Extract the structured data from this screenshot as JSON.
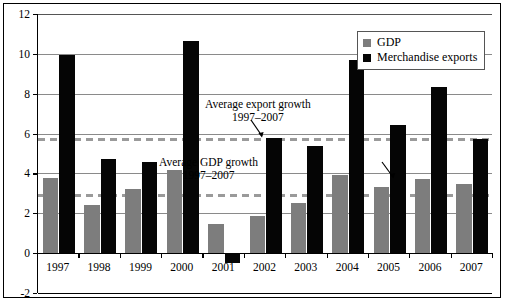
{
  "chart_data": {
    "type": "bar",
    "title": "",
    "subtitle": "",
    "xlabel": "",
    "ylabel": "",
    "categories": [
      "1997",
      "1998",
      "1999",
      "2000",
      "2001",
      "2002",
      "2003",
      "2004",
      "2005",
      "2006",
      "2007"
    ],
    "series": [
      {
        "name": "GDP",
        "color": "#7d7d7d",
        "values": [
          3.75,
          2.4,
          3.2,
          4.15,
          1.45,
          1.85,
          2.5,
          3.9,
          3.3,
          3.7,
          3.45
        ]
      },
      {
        "name": "Merchandise exports",
        "color": "#050505",
        "values": [
          9.95,
          4.7,
          4.55,
          10.65,
          -0.5,
          5.75,
          5.35,
          9.7,
          6.45,
          8.35,
          5.7
        ]
      }
    ],
    "ylim": [
      -2,
      12
    ],
    "yticks": [
      -2,
      0,
      2,
      4,
      6,
      8,
      10,
      12
    ],
    "ytick_labels": [
      "-2",
      "0",
      "2",
      "4",
      "6",
      "8",
      "10",
      "12"
    ],
    "grid": true,
    "grid_axis": "y",
    "legend_position": "top-right",
    "reference_lines": [
      {
        "name": "average-export-growth",
        "value": 5.7,
        "style": "dashed",
        "color": "#9a9a9a",
        "label_line1": "Average export growth",
        "label_line2": "1997–2007"
      },
      {
        "name": "average-gdp-growth",
        "value": 2.9,
        "style": "dashed",
        "color": "#9a9a9a",
        "label_line1": "Average GDP growth",
        "label_line2": "1997–2007"
      }
    ]
  },
  "legend": {
    "items": [
      {
        "label": "GDP",
        "color": "#7d7d7d"
      },
      {
        "label": "Merchandise exports",
        "color": "#050505"
      }
    ]
  },
  "annotations": {
    "export_growth": {
      "line1": "Average export growth",
      "line2": "1997–2007"
    },
    "gdp_growth": {
      "line1": "Average GDP growth",
      "line2": "1997–2007"
    }
  }
}
